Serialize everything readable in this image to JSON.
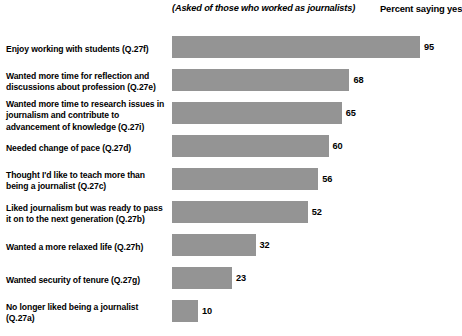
{
  "header": {
    "note": "(Asked of those who worked as journalists)",
    "percent_label": "Percent saying yes"
  },
  "style": {
    "bar_color": "#949494",
    "background_color": "#ffffff",
    "text_color": "#000000"
  },
  "chart_data": {
    "type": "bar",
    "orientation": "horizontal",
    "title": "",
    "subtitle": "(Asked of those who worked as journalists)",
    "xlabel": "Percent saying yes",
    "ylabel": "",
    "xlim": [
      0,
      100
    ],
    "grid": false,
    "legend": "none",
    "value_suffix": "",
    "categories": [
      "Enjoy working with students (Q.27f)",
      "Wanted more time for reflection and discussions about profession (Q.27e)",
      "Wanted more time to research issues in journalism and contribute to advancement of knowledge (Q.27i)",
      "Needed change of pace (Q.27d)",
      "Thought I'd like to teach more than being a journalist (Q.27c)",
      "Liked journalism but was ready to pass it on to the next generation (Q.27b)",
      "Wanted a more relaxed life (Q.27h)",
      "Wanted security of tenure (Q.27g)",
      "No longer liked being a journalist (Q.27a)"
    ],
    "values": [
      95,
      68,
      65,
      60,
      56,
      52,
      32,
      23,
      10
    ],
    "value_labels": [
      "95",
      "68",
      "65",
      "60",
      "56",
      "52",
      "32",
      "23",
      "10"
    ]
  }
}
